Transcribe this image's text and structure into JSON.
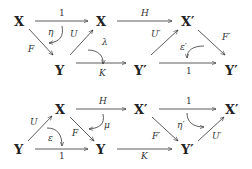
{
  "diagrams": [
    {
      "name": "top",
      "nodes": [
        {
          "id": "t_x1",
          "label": "X"
        },
        {
          "id": "t_x2",
          "label": "X"
        },
        {
          "id": "t_x3",
          "label": "X′"
        },
        {
          "id": "t_y1",
          "label": "Y"
        },
        {
          "id": "t_y2",
          "label": "Y′"
        },
        {
          "id": "t_y3",
          "label": "Y′"
        }
      ],
      "arrows": [
        {
          "from": "t_x1",
          "to": "t_x2",
          "label": "1"
        },
        {
          "from": "t_x2",
          "to": "t_x3",
          "label": "H"
        },
        {
          "from": "t_x1",
          "to": "t_y1",
          "label": "F"
        },
        {
          "from": "t_y1",
          "to": "t_x2",
          "label": "U"
        },
        {
          "from": "t_y1",
          "to": "t_y2",
          "label": "K"
        },
        {
          "from": "t_y2",
          "to": "t_x3",
          "label": "U′"
        },
        {
          "from": "t_x3",
          "to": "t_y3",
          "label": "F′"
        },
        {
          "from": "t_y2",
          "to": "t_y3",
          "label": "1"
        }
      ],
      "twocells": [
        {
          "label": "η"
        },
        {
          "label": "λ"
        },
        {
          "label": "ε′"
        }
      ]
    },
    {
      "name": "bottom",
      "nodes": [
        {
          "id": "b_x1",
          "label": "X"
        },
        {
          "id": "b_x2",
          "label": "X′"
        },
        {
          "id": "b_x3",
          "label": "X′"
        },
        {
          "id": "b_y1",
          "label": "Y"
        },
        {
          "id": "b_y2",
          "label": "Y"
        },
        {
          "id": "b_y3",
          "label": "Y′"
        }
      ],
      "arrows": [
        {
          "from": "b_y1",
          "to": "b_x1",
          "label": "U"
        },
        {
          "from": "b_x1",
          "to": "b_x2",
          "label": "H"
        },
        {
          "from": "b_x2",
          "to": "b_x3",
          "label": "1"
        },
        {
          "from": "b_x1",
          "to": "b_y2",
          "label": "F"
        },
        {
          "from": "b_y1",
          "to": "b_y2",
          "label": "1"
        },
        {
          "from": "b_y2",
          "to": "b_y3",
          "label": "K"
        },
        {
          "from": "b_x2",
          "to": "b_y3",
          "label": "F′"
        },
        {
          "from": "b_y3",
          "to": "b_x3",
          "label": "U′"
        }
      ],
      "twocells": [
        {
          "label": "ε"
        },
        {
          "label": "μ"
        },
        {
          "label": "η′"
        }
      ]
    }
  ]
}
